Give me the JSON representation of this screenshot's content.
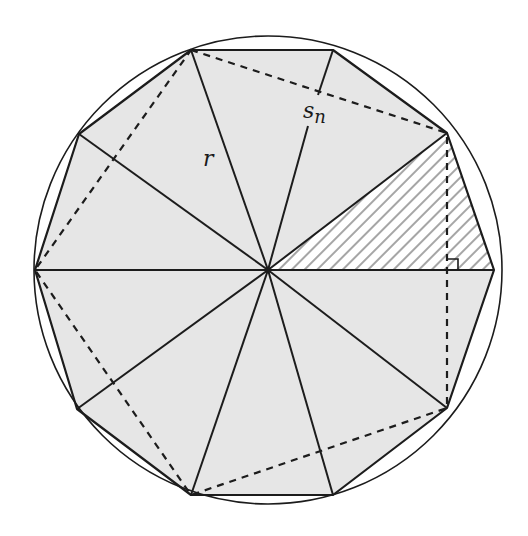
{
  "diagram": {
    "type": "inscribed-regular-decagon",
    "sides": 10,
    "circle": {
      "cx": 268,
      "cy": 270,
      "r": 234
    },
    "center": {
      "x": 268,
      "y": 270
    },
    "vertices": [
      [
        494,
        270
      ],
      [
        447,
        133
      ],
      [
        333,
        50
      ],
      [
        191,
        50
      ],
      [
        79,
        134
      ],
      [
        35,
        270
      ],
      [
        77,
        409
      ],
      [
        191,
        495
      ],
      [
        333,
        495
      ],
      [
        447,
        408
      ]
    ],
    "dashed_pentagon": [
      [
        191,
        50
      ],
      [
        447,
        133
      ],
      [
        447,
        408
      ],
      [
        191,
        495
      ],
      [
        35,
        270
      ]
    ],
    "hatched_triangle": [
      [
        268,
        270
      ],
      [
        447,
        133
      ],
      [
        494,
        270
      ]
    ],
    "perpendicular": {
      "from": [
        447,
        133
      ],
      "to": [
        447,
        408
      ],
      "foot": [
        447,
        270
      ]
    },
    "labels": {
      "radius": "r",
      "side_base": "s",
      "side_sub": "n"
    },
    "colors": {
      "fill": "#e6e6e6",
      "stroke": "#1c1c1c",
      "hatch": "#a6a6a6",
      "background": "#ffffff"
    }
  }
}
